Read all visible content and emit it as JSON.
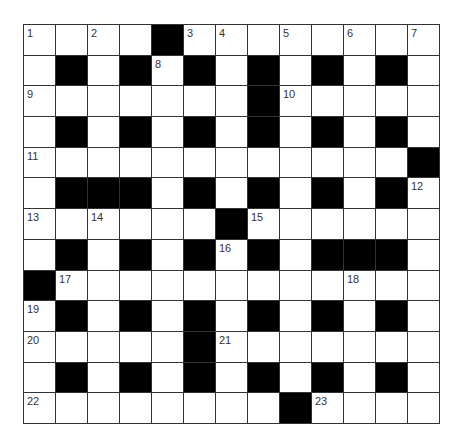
{
  "puzzle": {
    "rows": 13,
    "cols": 13,
    "colors": {
      "block": "#000000",
      "cell": "#ffffff",
      "line": "#333333",
      "number": "#333333"
    },
    "grid": [
      "....#........",
      ".#.#.#.#.#.#.",
      ".......#.....",
      ".#.#.#.#.#.#.",
      "............#",
      ".###.#.#.#.#.",
      "......#......",
      ".#.#.#.#.###.",
      "#............",
      ".#.#.#.#.#.#.",
      ".....#.......",
      ".#.#.#.#.#.#.",
      "........#...."
    ],
    "numbers": [
      {
        "r": 0,
        "c": 0,
        "n": "1"
      },
      {
        "r": 0,
        "c": 2,
        "n": "2"
      },
      {
        "r": 0,
        "c": 5,
        "n": "3"
      },
      {
        "r": 0,
        "c": 6,
        "n": "4"
      },
      {
        "r": 0,
        "c": 8,
        "n": "5"
      },
      {
        "r": 0,
        "c": 10,
        "n": "6"
      },
      {
        "r": 0,
        "c": 12,
        "n": "7"
      },
      {
        "r": 1,
        "c": 4,
        "n": "8"
      },
      {
        "r": 2,
        "c": 0,
        "n": "9"
      },
      {
        "r": 2,
        "c": 8,
        "n": "10"
      },
      {
        "r": 4,
        "c": 0,
        "n": "11"
      },
      {
        "r": 5,
        "c": 12,
        "n": "12"
      },
      {
        "r": 6,
        "c": 0,
        "n": "13"
      },
      {
        "r": 6,
        "c": 2,
        "n": "14"
      },
      {
        "r": 6,
        "c": 7,
        "n": "15"
      },
      {
        "r": 7,
        "c": 6,
        "n": "16"
      },
      {
        "r": 8,
        "c": 1,
        "n": "17"
      },
      {
        "r": 8,
        "c": 10,
        "n": "18"
      },
      {
        "r": 9,
        "c": 0,
        "n": "19"
      },
      {
        "r": 10,
        "c": 0,
        "n": "20"
      },
      {
        "r": 10,
        "c": 6,
        "n": "21"
      },
      {
        "r": 12,
        "c": 0,
        "n": "22"
      },
      {
        "r": 12,
        "c": 9,
        "n": "23"
      }
    ]
  }
}
